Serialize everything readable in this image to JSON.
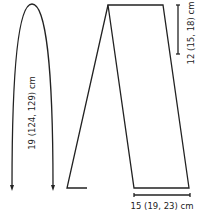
{
  "diagram": {
    "type": "knitting-schematic",
    "stroke_color": "#222222",
    "background": "#ffffff",
    "measurements": {
      "length": {
        "label": "19 (124, 129) cm",
        "orientation": "vertical",
        "position": "left"
      },
      "fold_depth": {
        "label": "12 (15, 18) cm",
        "orientation": "vertical",
        "position": "top-right"
      },
      "width": {
        "label": "15 (19, 23) cm",
        "orientation": "horizontal",
        "position": "bottom-right"
      }
    }
  }
}
